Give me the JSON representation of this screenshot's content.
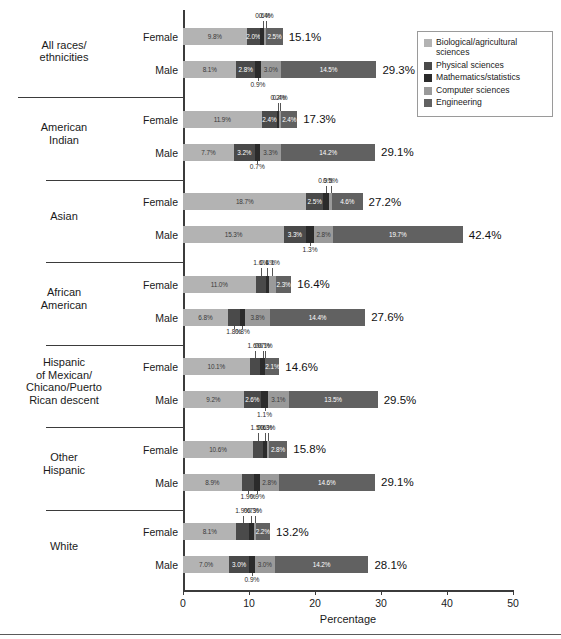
{
  "chart": {
    "xlabel": "Percentage",
    "xticks": [
      "0",
      "10",
      "20",
      "30",
      "40",
      "50"
    ],
    "xlim": [
      0,
      50
    ]
  },
  "legend": {
    "items": [
      {
        "label": "Biological/agricultural sciences",
        "color": "#b3b3b3"
      },
      {
        "label": "Physical sciences",
        "color": "#4a4a4a"
      },
      {
        "label": "Mathematics/statistics",
        "color": "#2b2b2b"
      },
      {
        "label": "Computer sciences",
        "color": "#9a9a9a"
      },
      {
        "label": "Engineering",
        "color": "#616161"
      }
    ]
  },
  "series_labels": {
    "female": "Female",
    "male": "Male"
  },
  "chart_data": {
    "type": "bar",
    "orientation": "horizontal",
    "stacked": true,
    "title": "",
    "xlabel": "Percentage",
    "ylabel": "",
    "xlim": [
      0,
      50
    ],
    "xticks": [
      0,
      10,
      20,
      30,
      40,
      50
    ],
    "grid": false,
    "legend_position": "top-right",
    "fields": [
      "Biological/agricultural sciences",
      "Physical sciences",
      "Mathematics/statistics",
      "Computer sciences",
      "Engineering"
    ],
    "categories": [
      "All races/ethnicities",
      "American Indian",
      "Asian",
      "African American",
      "Hispanic of Mexican/Chicano/Puerto Rican descent",
      "Other Hispanic",
      "White"
    ],
    "rows": [
      {
        "group": "All races/ethnicities",
        "sex": "Female",
        "values": [
          9.8,
          2.0,
          0.6,
          0.4,
          2.5
        ],
        "total": 15.1
      },
      {
        "group": "All races/ethnicities",
        "sex": "Male",
        "values": [
          8.1,
          2.8,
          0.9,
          3.0,
          14.5
        ],
        "total": 29.3
      },
      {
        "group": "American Indian",
        "sex": "Female",
        "values": [
          11.9,
          2.4,
          0.2,
          0.4,
          2.4
        ],
        "total": 17.3
      },
      {
        "group": "American Indian",
        "sex": "Male",
        "values": [
          7.7,
          3.2,
          0.7,
          3.3,
          14.2
        ],
        "total": 29.1
      },
      {
        "group": "Asian",
        "sex": "Female",
        "values": [
          18.7,
          2.5,
          0.9,
          0.5,
          4.6
        ],
        "total": 27.2
      },
      {
        "group": "Asian",
        "sex": "Male",
        "values": [
          15.3,
          3.3,
          1.3,
          2.8,
          19.7
        ],
        "total": 42.4
      },
      {
        "group": "African American",
        "sex": "Female",
        "values": [
          11.0,
          1.6,
          0.4,
          1.1,
          2.3
        ],
        "total": 16.4
      },
      {
        "group": "African American",
        "sex": "Male",
        "values": [
          6.8,
          1.8,
          0.8,
          3.8,
          14.4
        ],
        "total": 27.6
      },
      {
        "group": "Hispanic of Mexican/Chicano/Puerto Rican descent",
        "sex": "Female",
        "values": [
          10.1,
          1.6,
          0.7,
          0.1,
          2.1
        ],
        "total": 14.6
      },
      {
        "group": "Hispanic of Mexican/Chicano/Puerto Rican descent",
        "sex": "Male",
        "values": [
          9.2,
          2.6,
          1.1,
          3.1,
          13.5
        ],
        "total": 29.5
      },
      {
        "group": "Other Hispanic",
        "sex": "Female",
        "values": [
          10.6,
          1.5,
          0.6,
          0.3,
          2.8
        ],
        "total": 15.8
      },
      {
        "group": "Other Hispanic",
        "sex": "Male",
        "values": [
          8.9,
          1.9,
          0.9,
          2.8,
          14.6
        ],
        "total": 29.1
      },
      {
        "group": "White",
        "sex": "Female",
        "values": [
          8.1,
          1.9,
          0.7,
          0.3,
          2.2
        ],
        "total": 13.2
      },
      {
        "group": "White",
        "sex": "Male",
        "values": [
          7.0,
          3.0,
          0.9,
          3.0,
          14.2
        ],
        "total": 28.1
      }
    ]
  },
  "groups": [
    {
      "label_lines": [
        "All races/",
        "ethnicities"
      ]
    },
    {
      "label_lines": [
        "American",
        "Indian"
      ]
    },
    {
      "label_lines": [
        "Asian"
      ]
    },
    {
      "label_lines": [
        "African",
        "American"
      ]
    },
    {
      "label_lines": [
        "Hispanic",
        "of Mexican/",
        "Chicano/Puerto",
        "Rican descent"
      ]
    },
    {
      "label_lines": [
        "Other",
        "Hispanic"
      ]
    },
    {
      "label_lines": [
        "White"
      ]
    }
  ]
}
